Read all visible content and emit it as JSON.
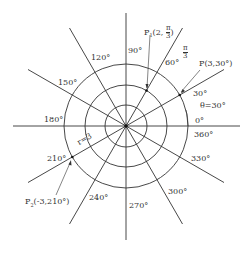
{
  "diagram": {
    "type": "polar-coordinate-grid",
    "center": {
      "x": 126,
      "y": 126
    },
    "circle_radii_px": [
      21,
      41,
      62
    ],
    "ray_length_px": 113,
    "ray_angles_deg": [
      0,
      30,
      60,
      90,
      120,
      150,
      180,
      210,
      240,
      270,
      300,
      330
    ],
    "line_color": "#333333",
    "angle_labels": [
      {
        "text": "0°",
        "angle": 0
      },
      {
        "text": "360°",
        "angle": 360
      },
      {
        "text": "30°",
        "angle": 30
      },
      {
        "text": "60°",
        "angle": 60
      },
      {
        "text": "90°",
        "angle": 90
      },
      {
        "text": "120°",
        "angle": 120
      },
      {
        "text": "150°",
        "angle": 150
      },
      {
        "text": "180°",
        "angle": 180
      },
      {
        "text": "210°",
        "angle": 210
      },
      {
        "text": "240°",
        "angle": 240
      },
      {
        "text": "270°",
        "angle": 270
      },
      {
        "text": "300°",
        "angle": 300
      },
      {
        "text": "330°",
        "angle": 330
      }
    ],
    "annotations": {
      "p1_prefix": "P",
      "p1_sub": "1",
      "p1_open": "(2, ",
      "p1_num": "π",
      "p1_den": "3",
      "p1_close": ")",
      "pi_over_3_num": "π",
      "pi_over_3_den": "3",
      "p": "P(3,30°)",
      "theta": "θ=30°",
      "radius": "r=3",
      "p2_prefix": "P",
      "p2_sub": "2",
      "p2_rest": "(-3,210°)"
    },
    "points": [
      {
        "name": "P1",
        "r": 2,
        "theta": "π/3"
      },
      {
        "name": "P",
        "r": 3,
        "theta": "30°"
      },
      {
        "name": "P2",
        "r": -3,
        "theta": "210°"
      }
    ]
  }
}
